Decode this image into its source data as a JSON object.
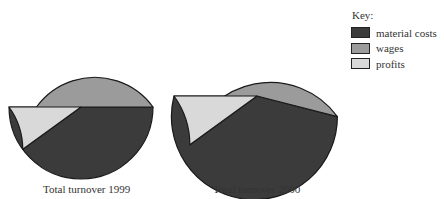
{
  "chart_data": [
    {
      "type": "pie",
      "title": "Total turnover 1999",
      "categories": [
        "material costs",
        "wages",
        "profits"
      ],
      "values": [
        50,
        40,
        10
      ],
      "unit": "%",
      "start_angle_deg": 180,
      "direction": "counterclockwise-from-left-via-bottom",
      "legend_position": "right"
    },
    {
      "type": "pie",
      "title": "Total turnover 2000",
      "categories": [
        "material costs",
        "wages",
        "profits"
      ],
      "values": [
        54,
        36,
        10
      ],
      "unit": "%",
      "start_angle_deg": 180,
      "direction": "counterclockwise-from-left-via-bottom",
      "legend_position": "right",
      "note": "Drawn larger than 1999 pie, indicating higher total turnover"
    }
  ],
  "pies": [
    {
      "label": "Total turnover 1999",
      "cx": 81,
      "cy": 107,
      "r": 72,
      "values": [
        50,
        40,
        10
      ]
    },
    {
      "label": "Total turnover 2000",
      "cx": 257,
      "cy": 96,
      "r": 83,
      "values": [
        54,
        36,
        10
      ]
    }
  ],
  "legend": {
    "title": "Key:",
    "items": [
      {
        "label": "material costs",
        "color": "#3b3b3b"
      },
      {
        "label": "wages",
        "color": "#9b9b9b"
      },
      {
        "label": "profits",
        "color": "#d9d9d9"
      }
    ]
  }
}
